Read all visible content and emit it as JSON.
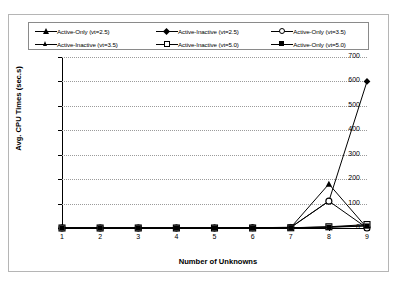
{
  "chart_data": {
    "type": "line",
    "title": "",
    "xlabel": "Number of Unknowns",
    "ylabel": "Avg. CPU Times (sec.s)",
    "x": [
      1,
      2,
      3,
      4,
      5,
      6,
      7,
      8,
      9
    ],
    "xlim": [
      1,
      9
    ],
    "ylim": [
      0,
      700
    ],
    "ytick_labels": [
      "0",
      "100",
      "200",
      "300",
      "400",
      "500",
      "600",
      "700"
    ],
    "ytick_values": [
      0,
      100,
      200,
      300,
      400,
      500,
      600,
      700
    ],
    "xtick_labels": [
      "1",
      "2",
      "3",
      "4",
      "5",
      "6",
      "7",
      "8",
      "9"
    ],
    "grid": "horizontal-dotted",
    "legend_position": "top",
    "series": [
      {
        "name": "Active-Only (vt=2.5)",
        "marker": "filled-triangle",
        "values": [
          0,
          0,
          0,
          0,
          0,
          1,
          2,
          180,
          0
        ]
      },
      {
        "name": "Active-Inactive (vt=2.5)",
        "marker": "filled-diamond",
        "values": [
          0,
          0,
          0,
          0,
          0,
          1,
          3,
          110,
          600
        ]
      },
      {
        "name": "Active-Only (vt=3.5)",
        "marker": "open-circle",
        "values": [
          0,
          0,
          0,
          0,
          0,
          1,
          2,
          110,
          0
        ]
      },
      {
        "name": "Active-Inactive (vt=3.5)",
        "marker": "small-filled-triangle",
        "values": [
          0,
          0,
          0,
          0,
          0,
          0,
          1,
          4,
          10
        ]
      },
      {
        "name": "Active-Inactive (vt=5.0)",
        "marker": "open-square",
        "values": [
          0,
          0,
          0,
          0,
          0,
          0,
          1,
          5,
          14
        ]
      },
      {
        "name": "Active-Only (vt=5.0)",
        "marker": "filled-square",
        "values": [
          0,
          0,
          0,
          0,
          0,
          0,
          1,
          3,
          8
        ]
      }
    ]
  },
  "legend": {
    "items": [
      {
        "label": "Active-Only (vt=2.5)",
        "marker": "filled-triangle"
      },
      {
        "label": "Active-Inactive (vt=2.5)",
        "marker": "filled-diamond"
      },
      {
        "label": "Active-Only (vt=3.5)",
        "marker": "open-circle"
      },
      {
        "label": "Active-Inactive (vt=3.5)",
        "marker": "small-filled-triangle"
      },
      {
        "label": "Active-Inactive (vt=5.0)",
        "marker": "open-square"
      },
      {
        "label": "Active-Only (vt=5.0)",
        "marker": "filled-square"
      }
    ]
  }
}
